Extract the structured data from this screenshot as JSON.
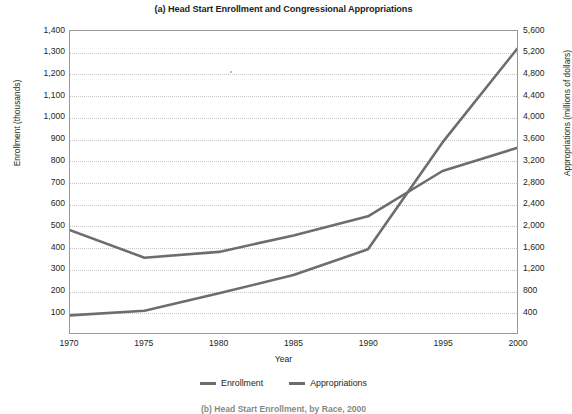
{
  "figure": {
    "title": "(a) Head Start Enrollment and Congressional Appropriations",
    "sub_caption": "(b) Head Start Enrollment, by Race, 2000"
  },
  "axes": {
    "x_label": "Year",
    "y_left_label": "Enrollment (thousands)",
    "y_right_label": "Appropriations (millions of dollars)",
    "x_ticks": [
      "1970",
      "1975",
      "1980",
      "1985",
      "1990",
      "1995",
      "2000"
    ],
    "y_left_ticks": [
      "1,400",
      "1,300",
      "1,200",
      "1,100",
      "1,000",
      "900",
      "800",
      "700",
      "600",
      "500",
      "400",
      "300",
      "200",
      "100"
    ],
    "y_right_ticks": [
      "5,600",
      "5,200",
      "4,800",
      "4,400",
      "4,000",
      "3,600",
      "3,200",
      "2,800",
      "2,400",
      "2,000",
      "1,600",
      "1,200",
      "800",
      "400"
    ]
  },
  "legend": {
    "items": [
      {
        "label": "Enrollment",
        "color": "#6d6d6d"
      },
      {
        "label": "Appropriations",
        "color": "#6d6d6d"
      }
    ]
  },
  "colors": {
    "line": "#6d6d6d",
    "frame": "#9a9a9a",
    "grid": "#c8c8c8",
    "text": "#231f20"
  },
  "chart_data": {
    "type": "line",
    "title": "(a) Head Start Enrollment and Congressional Appropriations",
    "xlabel": "Year",
    "ylabel": "Enrollment (thousands)",
    "y2label": "Appropriations (millions of dollars)",
    "x": [
      1970,
      1975,
      1980,
      1985,
      1990,
      1995,
      2000
    ],
    "xlim": [
      1970,
      2000
    ],
    "ylim": [
      0,
      1400
    ],
    "y2lim": [
      0,
      5600
    ],
    "grid": true,
    "legend_position": "bottom",
    "series": [
      {
        "name": "Enrollment",
        "axis": "left",
        "units": "thousands",
        "values": [
          477,
          349,
          376,
          452,
          541,
          751,
          858
        ]
      },
      {
        "name": "Appropriations",
        "axis": "right",
        "units": "millions of dollars",
        "values": [
          326,
          414,
          735,
          1075,
          1552,
          3534,
          5267
        ]
      }
    ]
  }
}
